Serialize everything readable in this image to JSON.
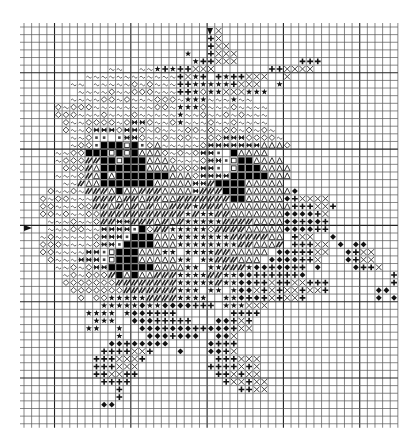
{
  "pattern": {
    "title": "",
    "cols": 49,
    "rows": 52,
    "cell_size": 7.63,
    "origin": [
      24,
      27
    ],
    "bold_every": 10,
    "center": {
      "col": 24,
      "row": 26
    },
    "legend_codes": {
      "~": "tilde",
      "o": "diamond-outline",
      "d": "filled-diamond",
      "+": "plus",
      "x": "cross",
      "*": "star",
      "^": "triangle-outline",
      "#": "black-square",
      "s": "white-square",
      "q": "small-square-dot",
      "/": "hatched-dark",
      "=": "dark-ribbon",
      ".": "empty"
    },
    "grid": [
      ".........................x.......................",
      "........................+x.......................",
      "........................+xx......................",
      ".....................*..+xxx.....................",
      "......................*++xxx........+++..........",
      "...........~~..~~*+*++xxx.......++xxxx...........",
      "........~~~~~~~~~~~~+x*+.+*++xxx..x..............",
      "......~~.~~~~~o~o~~~++*****+xxx..*...............",
      ".......~~~~o~~ooo~~~++*o**xxx***.................",
      "......~~~~oo~o~~~ooo~***~~~*~~...................",
      "....o~ooo~~~~~~~~oo~***o~~~o~~~~.................",
      "....ooo~~~o~~~o~~~~~*~~o~~o~o~~~.................",
      ".....o~~oooo~o==o~~o*~~~o~~o~~~~.................",
      ".....o~~o===o==o~o~~~oo~o~oo~o~o~................",
      "......~~oqq.q==o~~o~oo~~oo===oooo~...............",
      "......~ooq###s#qo^~~~~~o=======^^^o..............",
      "....~~oo###s#s#^^^o~o~o==q.#^^^^.................",
      "....~ooo//##s###^^^o~~~o==qs##^^^^...............",
      ".....ooo/^######^^^^ooo==q.s###^^^^..............",
      "....~~~o/^#^#######^^^o====#####^^^..............",
      ".....~~/^^#######^^^^^==/####^^^^^...............",
      "...o~~o~///^#^^///^^^^=///###^^^^^^d.............",
      "..o~oo~~~///^//^//^^///////##^^^^^d+xxxx.........",
      "..oo~~~oo//^/^/^/^^///*///^^^^^^^^^+++xx+........",
      "..oo~o~~oo///////////*/**//^^^^^^^dddd+x.........",
      "...~~~o~~o//==///^/^/*****////^^^^dd+dd+.........",
      "...~~~oo~~====q#o//*****o////^^^^^dddd++.........",
      "..~o~~~~~o===q###^^^*******/////^^.+xx..d........",
      "..ooo~~~~o==q####^^^********//^^^/.+++xx.d.dd....",
      "..oo~~~~==qs###^^^**.****//^^^^^.dd+++xx..d+xx...",
      "...o~~~===qs###^^^^^**.**///^^^.dddd++x...d+xx...",
      "....~~o~o==######^^^^**.**///*dd+dd++.d....d++x..",
      ".....~o~ooo/#^#^^///****//**dd++++++d...........+",
      ".....ooooooo////////*****/**dd++x++xx+++........+",
      "......ooooooo///////***.**.*ddx+x+xx+xx+......dd.",
      ".......o.oo*****////****..**d+d+x+xx+.........d.d",
      "..........*****d**dddd+++.***xxx.................",
      "........****.*dd++++.......++++..................",
      ".........***..ddd+++++...dd+x+...................",
      "........**..*..ddd+ddd++ddd+xx...................",
      "............*...ddd+ddd..ddx.....................",
      "...........dd+ddddd.....d+++.....................",
      "..........++++xx+...d...dd+x.....................",
      ".........+++xxx+.........+++xxx..................",
      ".........+++xxx.........++++x+x..................",
      ".........++xx++..........++x+xx..................",
      "..........++++............+xx+xx.................",
      "............+...............++xx.................",
      "............+.....................................",
      "..........dd......................................",
      ".................................................",
      "................................................."
    ]
  }
}
